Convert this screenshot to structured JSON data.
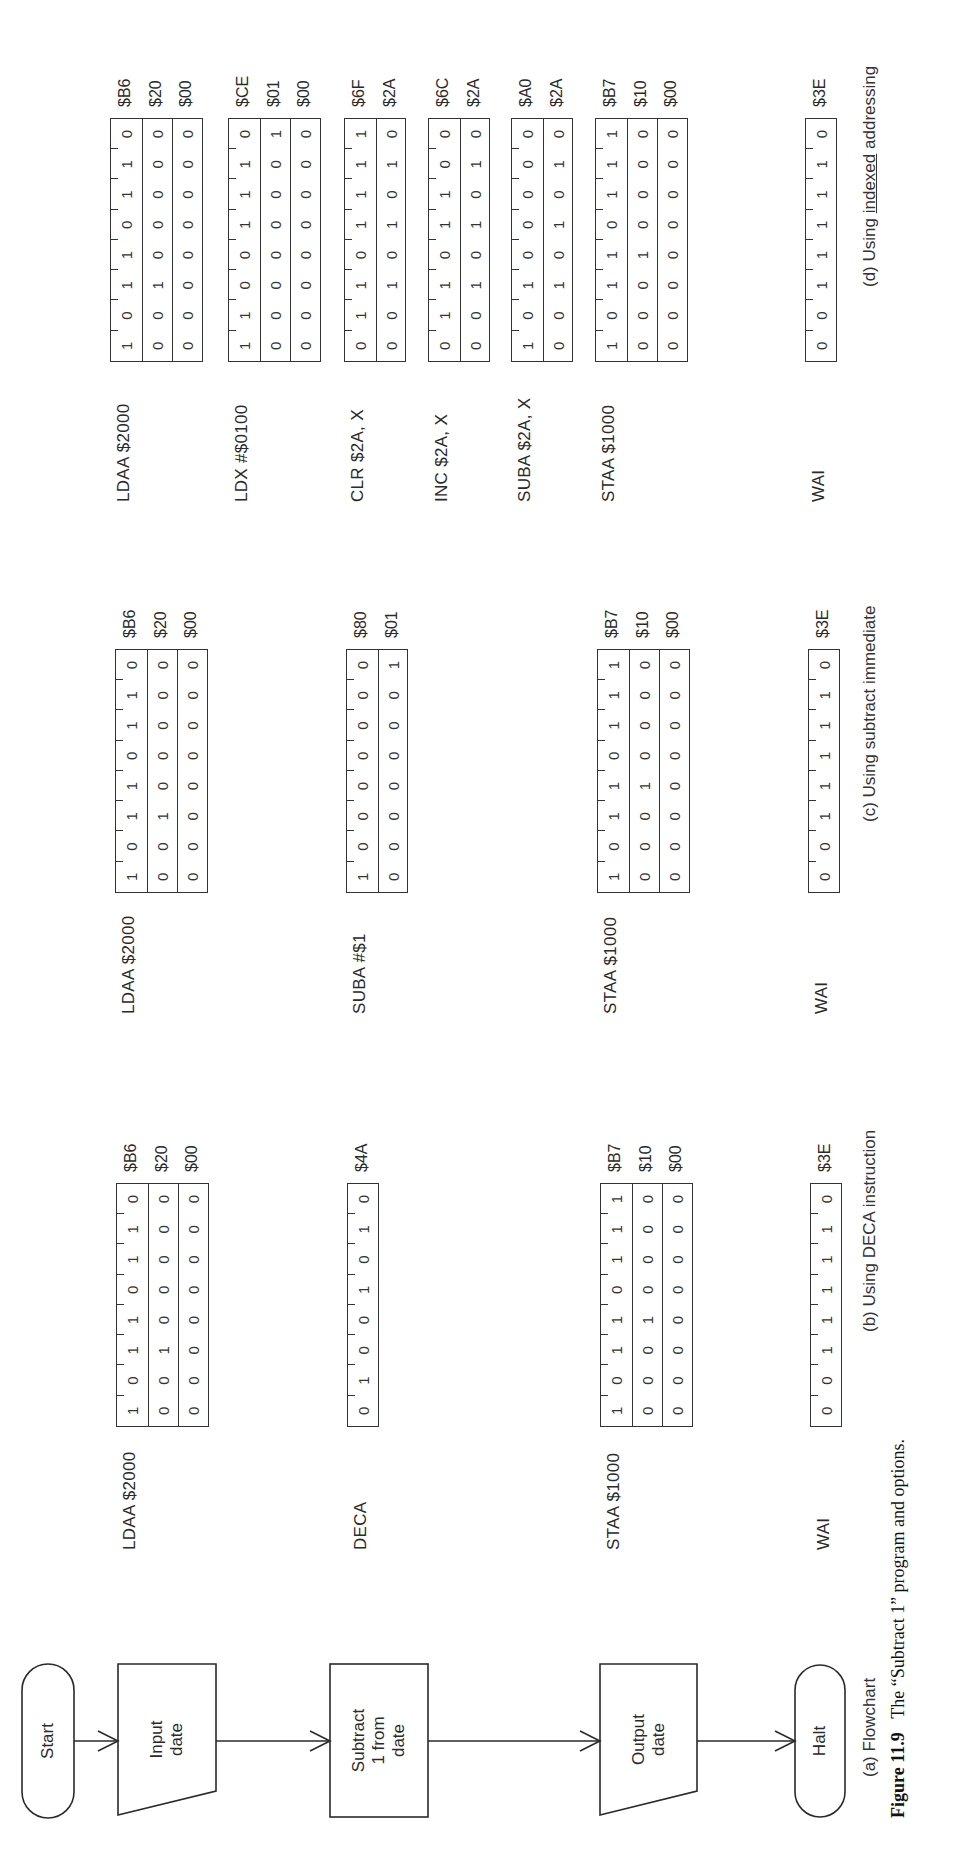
{
  "figure": {
    "number": "Figure 11.9",
    "caption": "The “Subtract 1” program and options."
  },
  "flowchart": {
    "caption_letter": "(a)",
    "caption_text": "Flowchart",
    "nodes": [
      {
        "id": "start",
        "shape": "terminator",
        "label": "Start"
      },
      {
        "id": "input",
        "shape": "parallelogram",
        "label": "Input\ndate"
      },
      {
        "id": "subtract",
        "shape": "process",
        "label": "Subtract\n1 from\ndate"
      },
      {
        "id": "output",
        "shape": "parallelogram",
        "label": "Output\ndate"
      },
      {
        "id": "halt",
        "shape": "terminator",
        "label": "Halt"
      }
    ]
  },
  "sections": [
    {
      "id": "b",
      "caption_letter": "(b)",
      "caption_text": "Using DECA instruction",
      "instructions": [
        {
          "mnemonic": "LDAA $2000",
          "bytes": [
            {
              "bits": "10110110",
              "hex": "$B6"
            },
            {
              "bits": "00100000",
              "hex": "$20"
            },
            {
              "bits": "00000000",
              "hex": "$00"
            }
          ]
        },
        {
          "mnemonic": "DECA",
          "bytes": [
            {
              "bits": "01001010",
              "hex": "$4A"
            }
          ]
        },
        {
          "mnemonic": "STAA $1000",
          "bytes": [
            {
              "bits": "10110111",
              "hex": "$B7"
            },
            {
              "bits": "00010000",
              "hex": "$10"
            },
            {
              "bits": "00000000",
              "hex": "$00"
            }
          ]
        },
        {
          "mnemonic": "WAI",
          "bytes": [
            {
              "bits": "00111110",
              "hex": "$3E"
            }
          ]
        }
      ]
    },
    {
      "id": "c",
      "caption_letter": "(c)",
      "caption_text": "Using subtract immediate",
      "instructions": [
        {
          "mnemonic": "LDAA $2000",
          "bytes": [
            {
              "bits": "10110110",
              "hex": "$B6"
            },
            {
              "bits": "00100000",
              "hex": "$20"
            },
            {
              "bits": "00000000",
              "hex": "$00"
            }
          ]
        },
        {
          "mnemonic": "SUBA #$1",
          "bytes": [
            {
              "bits": "10000000",
              "hex": "$80"
            },
            {
              "bits": "00000001",
              "hex": "$01"
            }
          ]
        },
        {
          "mnemonic": "STAA $1000",
          "bytes": [
            {
              "bits": "10110111",
              "hex": "$B7"
            },
            {
              "bits": "00010000",
              "hex": "$10"
            },
            {
              "bits": "00000000",
              "hex": "$00"
            }
          ]
        },
        {
          "mnemonic": "WAI",
          "bytes": [
            {
              "bits": "00111110",
              "hex": "$3E"
            }
          ]
        }
      ]
    },
    {
      "id": "d",
      "caption_letter": "(d)",
      "caption_text_before": "Using",
      "caption_text_underlined": "indexed",
      "caption_text_after": "addressing",
      "instructions": [
        {
          "mnemonic": "LDAA $2000",
          "bytes": [
            {
              "bits": "10110110",
              "hex": "$B6"
            },
            {
              "bits": "00100000",
              "hex": "$20"
            },
            {
              "bits": "00000000",
              "hex": "$00"
            }
          ]
        },
        {
          "mnemonic": "LDX #$0100",
          "bytes": [
            {
              "bits": "11001110",
              "hex": "$CE"
            },
            {
              "bits": "00000001",
              "hex": "$01"
            },
            {
              "bits": "00000000",
              "hex": "$00"
            }
          ]
        },
        {
          "mnemonic": "CLR $2A, X",
          "bytes": [
            {
              "bits": "01101111",
              "hex": "$6F"
            },
            {
              "bits": "00101010",
              "hex": "$2A"
            }
          ]
        },
        {
          "mnemonic": "INC $2A, X",
          "bytes": [
            {
              "bits": "01101100",
              "hex": "$6C"
            },
            {
              "bits": "00101010",
              "hex": "$2A"
            }
          ]
        },
        {
          "mnemonic": "SUBA $2A, X",
          "bytes": [
            {
              "bits": "10100000",
              "hex": "$A0"
            },
            {
              "bits": "00101010",
              "hex": "$2A"
            }
          ]
        },
        {
          "mnemonic": "STAA $1000",
          "bytes": [
            {
              "bits": "10110111",
              "hex": "$B7"
            },
            {
              "bits": "00010000",
              "hex": "$10"
            },
            {
              "bits": "00000000",
              "hex": "$00"
            }
          ]
        },
        {
          "mnemonic": "WAI",
          "bytes": [
            {
              "bits": "00111110",
              "hex": "$3E"
            }
          ]
        }
      ]
    }
  ]
}
